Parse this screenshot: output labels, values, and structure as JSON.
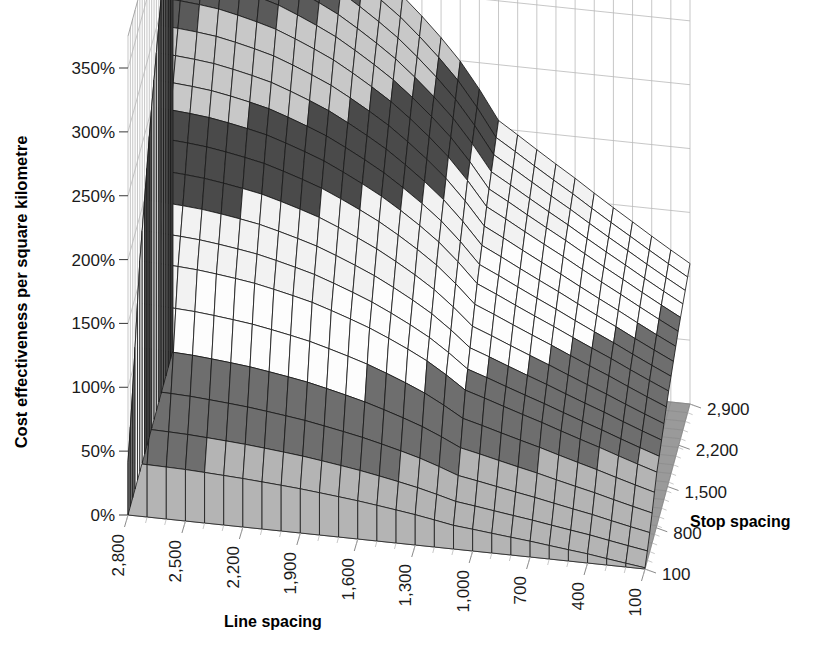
{
  "chart_data": {
    "type": "surface",
    "title": "",
    "xlabel": "Line spacing",
    "ylabel": "Cost effectiveness per square kilometre",
    "zlabel": "Stop spacing",
    "x_ticks": [
      "2,800",
      "2,500",
      "2,200",
      "1,900",
      "1,600",
      "1,300",
      "1,000",
      "700",
      "400",
      "100"
    ],
    "x_values": [
      2800,
      2500,
      2200,
      1900,
      1600,
      1300,
      1000,
      700,
      400,
      100
    ],
    "z_ticks": [
      "2,900",
      "2,200",
      "1,500",
      "800",
      "100"
    ],
    "z_values": [
      2900,
      2200,
      1500,
      800,
      100
    ],
    "y_ticks": [
      "0%",
      "50%",
      "100%",
      "150%",
      "200%",
      "250%",
      "300%",
      "350%"
    ],
    "y_values": [
      0,
      50,
      100,
      150,
      200,
      250,
      300,
      350
    ],
    "ylim": [
      0,
      375
    ],
    "grid": true,
    "legend": "none",
    "band_size": 50,
    "band_colors": [
      "#b4b4b4",
      "#6e6e6e",
      "#fdfdfd",
      "#f2f2f2",
      "#4a4a4a",
      "#c8c8c8",
      "#5a5a5a",
      "#3c3c3c"
    ],
    "band_labels": [
      "0%-50%",
      "50%-100%",
      "100%-150%",
      "150%-200%",
      "200%-250%",
      "250%-300%",
      "300%-350%",
      "350%+"
    ],
    "floor_color": "#9a9a9a",
    "mesh_color": "#1a1a1a",
    "wall_color": "#b9b9b9",
    "peak_value": 372,
    "min_value": 0,
    "x_count": 28,
    "z_count": 20,
    "series_note": "Surface of cost effectiveness versus line spacing and stop spacing; peak near large line spacing and large stop spacing, falling to zero at smallest spacings.",
    "surface_rows": [
      {
        "stop_spacing": 2900,
        "values": [
          372,
          368,
          360,
          348,
          332,
          312,
          288,
          262,
          232,
          200
        ]
      },
      {
        "stop_spacing": 2200,
        "values": [
          352,
          348,
          341,
          330,
          315,
          296,
          274,
          249,
          220,
          188
        ]
      },
      {
        "stop_spacing": 1500,
        "values": [
          318,
          314,
          308,
          298,
          284,
          267,
          246,
          222,
          195,
          163
        ]
      },
      {
        "stop_spacing": 800,
        "values": [
          258,
          255,
          250,
          242,
          230,
          215,
          196,
          174,
          148,
          118
        ]
      },
      {
        "stop_spacing": 100,
        "values": [
          96,
          94,
          90,
          85,
          78,
          69,
          58,
          45,
          28,
          4
        ]
      }
    ]
  },
  "axes": {
    "y_title": "Cost effectiveness per square kilometre",
    "x_title": "Line spacing",
    "z_title": "Stop spacing"
  }
}
